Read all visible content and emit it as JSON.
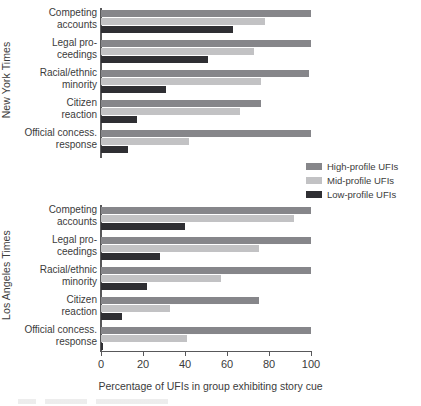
{
  "chart_data": {
    "type": "bar",
    "orientation": "horizontal",
    "title": "",
    "xlabel": "Percentage of UFIs in group exhibiting story cue",
    "ylabel": "",
    "xlim": [
      0,
      100
    ],
    "xticks": [
      0,
      20,
      40,
      60,
      80,
      100
    ],
    "grid": false,
    "legend_position": "right-middle",
    "categories": [
      "Competing accounts",
      "Legal proceedings",
      "Racial/ethnic minority",
      "Citizen reaction",
      "Official concess. response"
    ],
    "panels": [
      {
        "name": "New York Times",
        "series": [
          {
            "name": "High-profile UFIs",
            "values": [
              100,
              100,
              99,
              76,
              100
            ]
          },
          {
            "name": "Mid-profile UFIs",
            "values": [
              78,
              73,
              76,
              66,
              42
            ]
          },
          {
            "name": "Low-profile UFIs",
            "values": [
              63,
              51,
              31,
              17,
              13
            ]
          }
        ]
      },
      {
        "name": "Los Angeles Times",
        "series": [
          {
            "name": "High-profile UFIs",
            "values": [
              100,
              100,
              100,
              75,
              100
            ]
          },
          {
            "name": "Mid-profile UFIs",
            "values": [
              92,
              75,
              57,
              33,
              41
            ]
          },
          {
            "name": "Low-profile UFIs",
            "values": [
              40,
              28,
              22,
              10,
              1
            ]
          }
        ]
      }
    ],
    "colors": {
      "high_profile": "#86868a",
      "mid_profile": "#c2c2c4",
      "low_profile": "#2f2f33",
      "axis": "#58585a",
      "text": "#3b3b3b"
    }
  },
  "panel_titles": {
    "nyt": "New York Times",
    "lat": "Los Angeles Times"
  },
  "category_labels": {
    "nyt": [
      {
        "line1": "Competing",
        "line2": "accounts"
      },
      {
        "line1": "Legal pro-",
        "line2": "ceedings"
      },
      {
        "line1": "Racial/ethnic",
        "line2": "minority"
      },
      {
        "line1": "Citizen",
        "line2": "reaction"
      },
      {
        "line1": "Official concess.",
        "line2": "response"
      }
    ],
    "lat": [
      {
        "line1": "Competing",
        "line2": "accounts"
      },
      {
        "line1": "Legal pro-",
        "line2": "ceedings"
      },
      {
        "line1": "Racial/ethnic",
        "line2": "minority"
      },
      {
        "line1": "Citizen",
        "line2": "reaction"
      },
      {
        "line1": "Official concess.",
        "line2": "response"
      }
    ]
  },
  "xaxis": {
    "tick_labels": [
      "0",
      "20",
      "40",
      "60",
      "80",
      "100"
    ],
    "title": "Percentage of UFIs in group exhibiting story cue"
  },
  "legend": {
    "items": [
      {
        "label": "High-profile UFIs",
        "color": "#86868a"
      },
      {
        "label": "Mid-profile UFIs",
        "color": "#c2c2c4"
      },
      {
        "label": "Low-profile UFIs",
        "color": "#2f2f33"
      }
    ]
  }
}
